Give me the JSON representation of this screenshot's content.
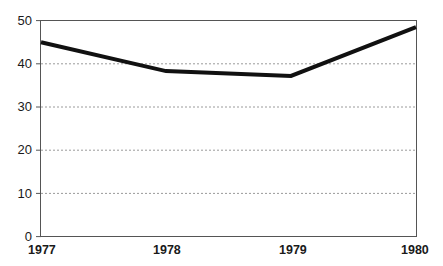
{
  "chart_data": {
    "type": "line",
    "title": "",
    "subtitle": "",
    "xlabel": "",
    "ylabel": "",
    "categories": [
      "1977",
      "1978",
      "1979",
      "1980"
    ],
    "x": [
      1977,
      1978,
      1979,
      1980
    ],
    "values": [
      45,
      38.3,
      37.2,
      48.5
    ],
    "series": [
      {
        "name": "",
        "values": [
          45,
          38.3,
          37.2,
          48.5
        ],
        "color": "#111111",
        "line_width": 4,
        "markers": false
      }
    ],
    "xlim": [
      1977,
      1980
    ],
    "ylim": [
      0,
      50
    ],
    "ytick_labels": [
      "0",
      "10",
      "20",
      "30",
      "40",
      "50"
    ],
    "ytick_values": [
      0,
      10,
      20,
      30,
      40,
      50
    ],
    "xtick_labels": [
      "1977",
      "1978",
      "1979",
      "1980"
    ],
    "grid": {
      "horizontal": true,
      "vertical": false,
      "style": "dotted",
      "color": "#9a9a9a",
      "at_values": [
        10,
        20,
        30,
        40
      ]
    },
    "legend": {
      "visible": false,
      "position": "none"
    },
    "frame": {
      "visible": true,
      "color": "#555555",
      "background": "#ffffff"
    }
  },
  "axis": {
    "y_labels": [
      {
        "text": "50",
        "value": 50
      },
      {
        "text": "40",
        "value": 40
      },
      {
        "text": "30",
        "value": 30
      },
      {
        "text": "20",
        "value": 20
      },
      {
        "text": "10",
        "value": 10
      },
      {
        "text": "0",
        "value": 0
      }
    ],
    "x_labels": [
      {
        "text": "1977",
        "value": 1977
      },
      {
        "text": "1978",
        "value": 1978
      },
      {
        "text": "1979",
        "value": 1979
      },
      {
        "text": "1980",
        "value": 1980
      }
    ]
  }
}
